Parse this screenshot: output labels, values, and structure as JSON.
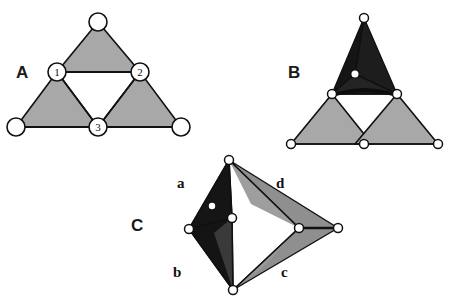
{
  "figure": {
    "background_color": "#ffffff",
    "stroke_color": "#111111",
    "node_fill": "#ffffff",
    "colors": {
      "light_gray_face": "#a8a8a8",
      "mid_gray_face": "#9a9a9a",
      "dark_face": "#151515",
      "dark_face_alt": "#242424",
      "gray_face_c": "#8f8f8f",
      "gray_face_c_dark": "#7c7c7c",
      "outline": "#111111",
      "text": "#111111"
    }
  },
  "panels": [
    {
      "id": "A",
      "label": "A",
      "label_pos": {
        "x": 16,
        "y": 78
      },
      "description": "open triangular net with three shaded corner triangles and numbered hinge nodes",
      "faces": [
        {
          "name": "top-face",
          "points": "98,22 57,72 140,72",
          "fill": "#a8a8a8"
        },
        {
          "name": "left-face",
          "points": "57,72 16,127 98,127",
          "fill": "#a8a8a8"
        },
        {
          "name": "right-face",
          "points": "140,72 98,127 181,127",
          "fill": "#a8a8a8"
        }
      ],
      "edges": [
        {
          "name": "hinge-edge-1-2",
          "x1": 57,
          "y1": 72,
          "x2": 140,
          "y2": 72
        },
        {
          "name": "hinge-edge-1-3",
          "x1": 57,
          "y1": 72,
          "x2": 98,
          "y2": 127
        },
        {
          "name": "hinge-edge-2-3",
          "x1": 140,
          "y1": 72,
          "x2": 98,
          "y2": 127
        },
        {
          "name": "base-edge",
          "x1": 16,
          "y1": 127,
          "x2": 181,
          "y2": 127
        }
      ],
      "nodes": [
        {
          "name": "node-apex",
          "x": 98,
          "y": 22,
          "r": 9,
          "label": ""
        },
        {
          "name": "node-1",
          "x": 57,
          "y": 72,
          "r": 9,
          "label": "1"
        },
        {
          "name": "node-2",
          "x": 140,
          "y": 72,
          "r": 9,
          "label": "2"
        },
        {
          "name": "node-3",
          "x": 98,
          "y": 127,
          "r": 9,
          "label": "3"
        },
        {
          "name": "node-bottom-left",
          "x": 16,
          "y": 127,
          "r": 9,
          "label": ""
        },
        {
          "name": "node-bottom-right",
          "x": 181,
          "y": 127,
          "r": 9,
          "label": ""
        }
      ]
    },
    {
      "id": "B",
      "label": "B",
      "label_pos": {
        "x": 288,
        "y": 78
      },
      "description": "partially folded net: top triangle folded up into a dark pyramid with an apex node, lower two triangles still flat",
      "faces": [
        {
          "name": "folded-face-left",
          "points": "364,18 332,94 355,74",
          "fill": "#151515"
        },
        {
          "name": "folded-face-right",
          "points": "364,18 397,94 355,74",
          "fill": "#1d1d1d"
        },
        {
          "name": "folded-face-front",
          "points": "332,94 397,94 355,74",
          "fill": "#242424"
        },
        {
          "name": "left-face",
          "points": "332,94 291,144 372,144",
          "fill": "#a8a8a8"
        },
        {
          "name": "right-face",
          "points": "397,94 355,144 438,144",
          "fill": "#a8a8a8"
        }
      ],
      "edges": [
        {
          "name": "fold-edge-left",
          "x1": 364,
          "y1": 18,
          "x2": 332,
          "y2": 94
        },
        {
          "name": "fold-edge-right",
          "x1": 364,
          "y1": 18,
          "x2": 397,
          "y2": 94
        },
        {
          "name": "fold-edge-apex-center",
          "x1": 364,
          "y1": 18,
          "x2": 355,
          "y2": 74
        },
        {
          "name": "hinge-edge-bottom",
          "x1": 332,
          "y1": 94,
          "x2": 397,
          "y2": 94
        },
        {
          "name": "inner-edge-left",
          "x1": 332,
          "y1": 94,
          "x2": 355,
          "y2": 74
        },
        {
          "name": "inner-edge-right",
          "x1": 397,
          "y1": 94,
          "x2": 355,
          "y2": 74
        },
        {
          "name": "base-edge",
          "x1": 291,
          "y1": 144,
          "x2": 438,
          "y2": 144
        }
      ],
      "nodes": [
        {
          "name": "node-apex",
          "x": 364,
          "y": 18,
          "r": 4.5,
          "label": ""
        },
        {
          "name": "node-center-pyramid",
          "x": 355,
          "y": 74,
          "r": 4.5,
          "label": ""
        },
        {
          "name": "node-hinge-left",
          "x": 332,
          "y": 94,
          "r": 4.5,
          "label": ""
        },
        {
          "name": "node-hinge-right",
          "x": 397,
          "y": 94,
          "r": 4.5,
          "label": ""
        },
        {
          "name": "node-bottom-left",
          "x": 291,
          "y": 144,
          "r": 4.5,
          "label": ""
        },
        {
          "name": "node-bottom-center",
          "x": 364,
          "y": 144,
          "r": 4.5,
          "label": ""
        },
        {
          "name": "node-bottom-right",
          "x": 438,
          "y": 144,
          "r": 4.5,
          "label": ""
        }
      ]
    },
    {
      "id": "C",
      "label": "C",
      "label_pos": {
        "x": 131,
        "y": 231
      },
      "description": "fully folded tetrahedral assembly seen edge-on, four labelled faces a, b, c, d",
      "faces": [
        {
          "name": "face-a",
          "points": "229,160 189,229 232,218",
          "fill": "#151515"
        },
        {
          "name": "face-b",
          "points": "189,229 233,290 232,218",
          "fill": "#141414"
        },
        {
          "name": "face-b-inner",
          "points": "232,218 233,290 215,232",
          "fill": "#3a3a3a"
        },
        {
          "name": "face-d",
          "points": "229,160 299,228 338,228",
          "fill": "#8f8f8f"
        },
        {
          "name": "face-d-inner",
          "points": "229,160 299,228 252,205",
          "fill": "#9c9c9c"
        },
        {
          "name": "face-c",
          "points": "233,290 299,228 338,228",
          "fill": "#8f8f8f"
        },
        {
          "name": "face-c-inner",
          "points": "233,290 299,228 268,262",
          "fill": "#9a9a9a"
        }
      ],
      "edges": [
        {
          "name": "edge-top-to-left",
          "x1": 229,
          "y1": 160,
          "x2": 189,
          "y2": 229
        },
        {
          "name": "edge-left-to-bottom",
          "x1": 189,
          "y1": 229,
          "x2": 233,
          "y2": 290
        },
        {
          "name": "edge-top-to-center-left",
          "x1": 229,
          "y1": 160,
          "x2": 232,
          "y2": 218
        },
        {
          "name": "edge-center-left-to-bottom",
          "x1": 232,
          "y1": 218,
          "x2": 233,
          "y2": 290
        },
        {
          "name": "edge-top-to-center-right",
          "x1": 229,
          "y1": 160,
          "x2": 299,
          "y2": 228
        },
        {
          "name": "edge-center-right-to-bottom",
          "x1": 299,
          "y1": 228,
          "x2": 233,
          "y2": 290
        },
        {
          "name": "edge-top-to-right",
          "x1": 229,
          "y1": 160,
          "x2": 338,
          "y2": 228
        },
        {
          "name": "edge-right-to-bottom",
          "x1": 338,
          "y1": 228,
          "x2": 233,
          "y2": 290
        },
        {
          "name": "edge-center-right-to-right",
          "x1": 299,
          "y1": 228,
          "x2": 338,
          "y2": 228
        }
      ],
      "nodes": [
        {
          "name": "node-top",
          "x": 229,
          "y": 160,
          "r": 4.5,
          "label": ""
        },
        {
          "name": "node-left",
          "x": 189,
          "y": 229,
          "r": 4.5,
          "label": ""
        },
        {
          "name": "node-center-left",
          "x": 232,
          "y": 218,
          "r": 4.5,
          "label": ""
        },
        {
          "name": "node-inner-dot",
          "x": 212,
          "y": 206,
          "r": 3.2,
          "label": ""
        },
        {
          "name": "node-center-right",
          "x": 299,
          "y": 228,
          "r": 4.5,
          "label": ""
        },
        {
          "name": "node-right",
          "x": 338,
          "y": 228,
          "r": 4.5,
          "label": ""
        },
        {
          "name": "node-bottom",
          "x": 233,
          "y": 290,
          "r": 4.5,
          "label": ""
        }
      ],
      "face_labels": [
        {
          "name": "face-label-a",
          "text": "a",
          "x": 177,
          "y": 188
        },
        {
          "name": "face-label-b",
          "text": "b",
          "x": 173,
          "y": 277
        },
        {
          "name": "face-label-c",
          "text": "c",
          "x": 281,
          "y": 277
        },
        {
          "name": "face-label-d",
          "text": "d",
          "x": 276,
          "y": 188
        }
      ]
    }
  ]
}
